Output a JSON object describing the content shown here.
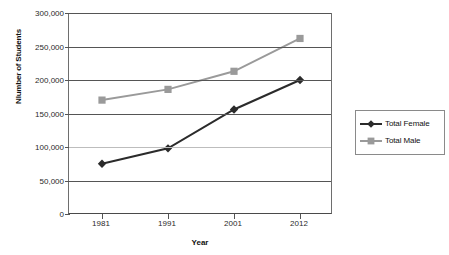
{
  "chart_data": {
    "type": "line",
    "title": "",
    "xlabel": "Year",
    "ylabel": "Nlumber of Students",
    "categories": [
      "1981",
      "1991",
      "2001",
      "2012"
    ],
    "ylim": [
      0,
      300000
    ],
    "ytick_labels": [
      "300,000",
      "250,000",
      "200,000",
      "150,000",
      "100,000",
      "50,000",
      "0"
    ],
    "ytick_values": [
      300000,
      250000,
      200000,
      150000,
      100000,
      50000,
      0
    ],
    "grid": true,
    "legend_position": "right",
    "series": [
      {
        "name": "Total Female",
        "color": "#2b2b2b",
        "marker": "diamond",
        "values": [
          75000,
          98000,
          156000,
          200000
        ]
      },
      {
        "name": "Total Male",
        "color": "#9a9a9a",
        "marker": "square",
        "values": [
          170000,
          186000,
          213000,
          262000
        ]
      }
    ]
  },
  "legend": {
    "items": [
      {
        "label": "Total Female"
      },
      {
        "label": "Total Male"
      }
    ]
  },
  "colors": {
    "female": "#2b2b2b",
    "male": "#9a9a9a",
    "axis": "#555555",
    "background": "#ffffff"
  }
}
